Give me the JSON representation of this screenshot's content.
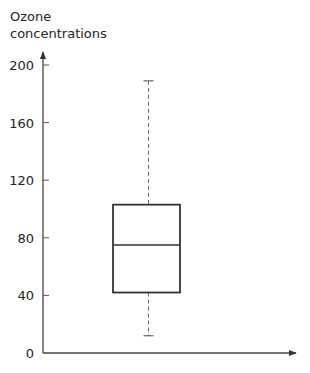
{
  "chart_data": {
    "type": "box",
    "title": "",
    "ylabel_lines": [
      "Ozone",
      "concentrations"
    ],
    "xlabel": "",
    "ylim": [
      0,
      200
    ],
    "yticks": [
      0,
      40,
      80,
      120,
      160,
      200
    ],
    "grid": false,
    "series": [
      {
        "name": "Ozone concentrations",
        "whisker_low": 12,
        "q1": 42,
        "median": 75,
        "q3": 103,
        "whisker_high": 189
      }
    ],
    "style": {
      "line_color": "#333333",
      "whisker_style": "dashed"
    }
  }
}
